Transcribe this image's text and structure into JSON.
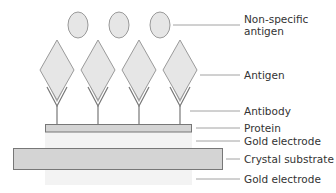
{
  "diagram": {
    "type": "biosensor-layer-schematic",
    "colors": {
      "shape_fill": "#e6e6e6",
      "shape_stroke": "#9a9a9a",
      "bar_fill": "#d4d4d4",
      "bar_stroke": "#777777",
      "electrode_fill": "#f3f3f3",
      "leader_line": "#8a8a8a",
      "text": "#333333"
    },
    "labels": [
      {
        "id": "non-specific-antigen",
        "line1": "Non-specific",
        "line2": "antigen"
      },
      {
        "id": "antigen",
        "text": "Antigen"
      },
      {
        "id": "antibody",
        "text": "Antibody"
      },
      {
        "id": "protein",
        "text": "Protein"
      },
      {
        "id": "gold-electrode-top",
        "text": "Gold electrode"
      },
      {
        "id": "crystal-substrate",
        "text": "Crystal substrate"
      },
      {
        "id": "gold-electrode-bottom",
        "text": "Gold electrode"
      }
    ],
    "counts": {
      "non_specific_antigens": 3,
      "antigens": 4,
      "antibodies": 4
    }
  }
}
